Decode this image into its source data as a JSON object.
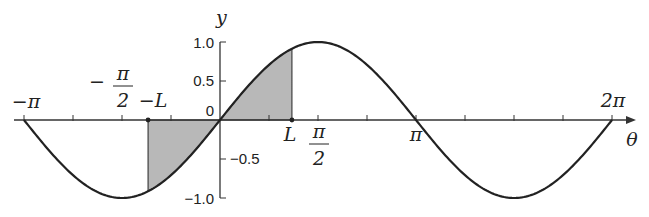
{
  "diagram": {
    "function": "y = sin(theta)",
    "axes": {
      "x_label": "θ",
      "y_label": "y",
      "x_range": [
        "-π",
        "2π"
      ],
      "y_range": [
        -1.0,
        1.0
      ]
    },
    "x_labels": {
      "neg_pi": "−π",
      "neg_half_pi_minus": "−",
      "pi_sym": "π",
      "two": "2",
      "neg_L": "−L",
      "L": "L",
      "pi": "π",
      "two_pi": "2π"
    },
    "y_ticks": [
      {
        "value": 1.0,
        "label": "1.0"
      },
      {
        "value": 0.5,
        "label": "0.5"
      },
      {
        "value": 0,
        "label": "0"
      },
      {
        "value": -0.5,
        "label": "−0.5"
      },
      {
        "value": -1.0,
        "label": "−1.0"
      }
    ],
    "x_tick_multiples_of_quarter_pi": [
      -4,
      -3,
      -2,
      -1,
      1,
      2,
      3,
      4,
      5,
      6,
      7,
      8
    ],
    "shaded_region": {
      "from": "-L",
      "to": "L",
      "L_over_pi": 0.367
    },
    "colors": {
      "curve": "#222222",
      "shade": "#b8b8b8",
      "axis": "#333333"
    }
  }
}
